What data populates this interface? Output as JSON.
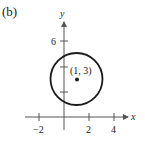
{
  "panel_label": "(b)",
  "axes": {
    "x_label": "x",
    "y_label": "y",
    "x_ticks": [
      {
        "value": -2,
        "label": "−2"
      },
      {
        "value": 2,
        "label": "2"
      },
      {
        "value": 4,
        "label": "4"
      }
    ],
    "y_ticks": [
      {
        "value": 2,
        "label": ""
      },
      {
        "value": 4,
        "label": ""
      },
      {
        "value": 6,
        "label": "6"
      }
    ]
  },
  "circle": {
    "center": [
      1,
      3
    ],
    "radius": 2,
    "center_label": "(1, 3)"
  },
  "colors": {
    "stroke": "#1a1a1a",
    "axis": "#555555"
  }
}
